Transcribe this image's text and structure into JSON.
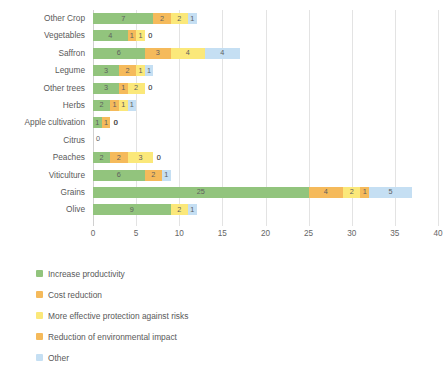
{
  "chart_data": {
    "type": "bar",
    "orientation": "horizontal",
    "stacked": true,
    "title": "",
    "xlabel": "",
    "ylabel": "",
    "xlim": [
      0,
      40
    ],
    "xticks": [
      0,
      5,
      10,
      15,
      20,
      25,
      30,
      35,
      40
    ],
    "grid": true,
    "legend_position": "bottom",
    "categories": [
      "Other Crop",
      "Vegetables",
      "Saffron",
      "Legume",
      "Other trees",
      "Herbs",
      "Apple cultivation",
      "Citrus",
      "Peaches",
      "Viticulture",
      "Grains",
      "Olive"
    ],
    "series": [
      {
        "name": "Increase productivity",
        "color": "#92c47d",
        "values": [
          7,
          4,
          6,
          3,
          3,
          2,
          1,
          0,
          2,
          6,
          25,
          9
        ]
      },
      {
        "name": "Cost reduction",
        "color": "#f5ba5b",
        "values": [
          2,
          1,
          3,
          2,
          1,
          1,
          1,
          0,
          2,
          2,
          4,
          0
        ]
      },
      {
        "name": "More effective protection against risks",
        "color": "#fbe87a",
        "values": [
          2,
          1,
          4,
          1,
          2,
          1,
          0,
          0,
          3,
          0,
          2,
          2
        ]
      },
      {
        "name": "Reduction of environmental impact",
        "color": "#f5ba5b",
        "values": [
          0,
          0,
          0,
          0,
          0,
          0,
          0,
          0,
          0,
          0,
          1,
          0
        ]
      },
      {
        "name": "Other",
        "color": "#c5dff3",
        "values": [
          1,
          0,
          4,
          1,
          0,
          1,
          0,
          0,
          0,
          1,
          5,
          1
        ]
      }
    ],
    "citrus_label": "0"
  },
  "legend": {
    "items": [
      {
        "label": "Increase productivity",
        "color": "#92c47d"
      },
      {
        "label": "Cost reduction",
        "color": "#f5ba5b"
      },
      {
        "label": "More effective protection against risks",
        "color": "#fbe87a"
      },
      {
        "label": "Reduction of environmental impact",
        "color": "#f5ba5b"
      },
      {
        "label": "Other",
        "color": "#c5dff3"
      }
    ]
  }
}
